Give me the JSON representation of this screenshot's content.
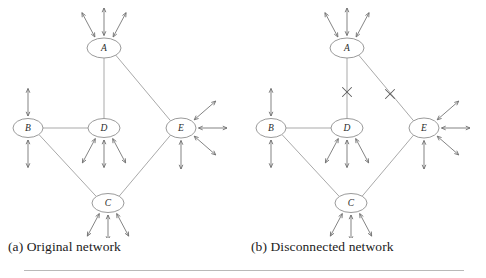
{
  "figure": {
    "background": "#ffffff",
    "line_color": "#9a9a9a",
    "node_stroke": "#8f8f8f",
    "arrow_color": "#6e6e6e",
    "x_mark_color": "#5f5f5f",
    "rule_color": "#b9b9b9"
  },
  "panels": [
    {
      "id": "a",
      "caption": "(a) Original network",
      "nodes": [
        {
          "id": "A",
          "label": "A",
          "cx": 104,
          "cy": 48,
          "rx": 17,
          "ry": 10
        },
        {
          "id": "B",
          "label": "B",
          "cx": 28,
          "cy": 128,
          "rx": 15,
          "ry": 9.5
        },
        {
          "id": "D",
          "label": "D",
          "cx": 104,
          "cy": 128,
          "rx": 16,
          "ry": 9.5
        },
        {
          "id": "E",
          "label": "E",
          "cx": 181,
          "cy": 128,
          "rx": 15,
          "ry": 10
        },
        {
          "id": "C",
          "label": "C",
          "cx": 108,
          "cy": 203,
          "rx": 16,
          "ry": 9.5
        }
      ],
      "edges": [
        {
          "from": "A",
          "to": "D",
          "cut": false
        },
        {
          "from": "A",
          "to": "E",
          "cut": false
        },
        {
          "from": "B",
          "to": "D",
          "cut": false
        },
        {
          "from": "B",
          "to": "C",
          "cut": false
        },
        {
          "from": "C",
          "to": "E",
          "cut": false
        }
      ],
      "external_links": [
        {
          "node": "A",
          "angles": [
            -118,
            -90,
            -62
          ],
          "length": 30
        },
        {
          "node": "B",
          "angles": [
            -90,
            90
          ],
          "length": 30
        },
        {
          "node": "D",
          "angles": [
            118,
            90,
            62
          ],
          "length": 30
        },
        {
          "node": "E",
          "angles": [
            -41,
            0,
            41,
            90
          ],
          "length": 31
        },
        {
          "node": "C",
          "angles": [
            118,
            90,
            62
          ],
          "length": 28
        }
      ]
    },
    {
      "id": "b",
      "caption": "(b) Disconnected network",
      "nodes": [
        {
          "id": "A",
          "label": "A",
          "cx": 104,
          "cy": 48,
          "rx": 17,
          "ry": 10
        },
        {
          "id": "B",
          "label": "B",
          "cx": 28,
          "cy": 128,
          "rx": 15,
          "ry": 9.5
        },
        {
          "id": "D",
          "label": "D",
          "cx": 104,
          "cy": 128,
          "rx": 16,
          "ry": 9.5
        },
        {
          "id": "E",
          "label": "E",
          "cx": 181,
          "cy": 128,
          "rx": 15,
          "ry": 10
        },
        {
          "id": "C",
          "label": "C",
          "cx": 108,
          "cy": 203,
          "rx": 16,
          "ry": 9.5
        }
      ],
      "edges": [
        {
          "from": "A",
          "to": "D",
          "cut": true
        },
        {
          "from": "A",
          "to": "E",
          "cut": true
        },
        {
          "from": "B",
          "to": "D",
          "cut": false
        },
        {
          "from": "B",
          "to": "C",
          "cut": false
        },
        {
          "from": "C",
          "to": "E",
          "cut": false
        }
      ],
      "external_links": [
        {
          "node": "A",
          "angles": [
            -118,
            -90,
            -62
          ],
          "length": 30
        },
        {
          "node": "B",
          "angles": [
            -90,
            90
          ],
          "length": 30
        },
        {
          "node": "D",
          "angles": [
            118,
            90,
            62
          ],
          "length": 30
        },
        {
          "node": "E",
          "angles": [
            -41,
            0,
            41,
            90
          ],
          "length": 31
        },
        {
          "node": "C",
          "angles": [
            118,
            90,
            62
          ],
          "length": 28
        }
      ],
      "cut_marks": [
        {
          "x": 104,
          "y": 92,
          "size": 9
        },
        {
          "x": 147,
          "y": 94,
          "size": 9
        }
      ]
    }
  ]
}
